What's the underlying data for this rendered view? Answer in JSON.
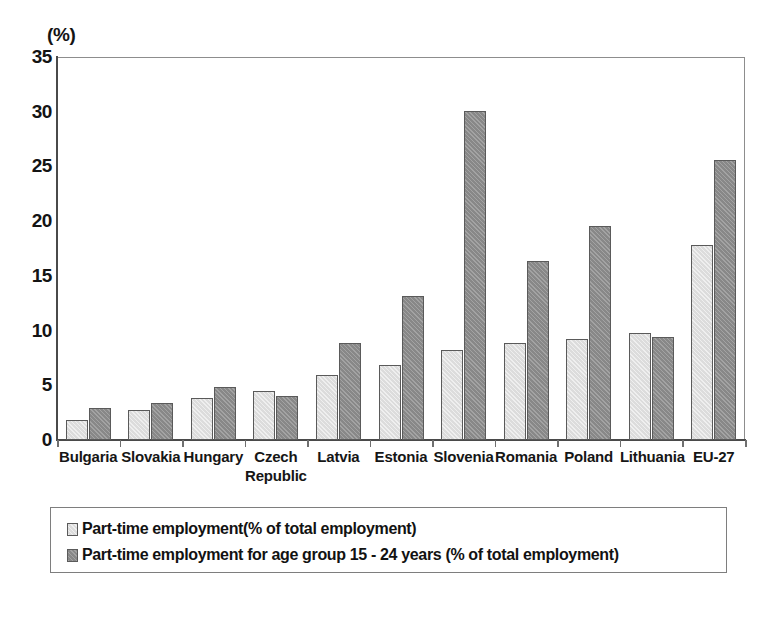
{
  "chart_data": {
    "type": "bar",
    "title": "",
    "subtitle": "",
    "xlabel": "",
    "ylabel": "",
    "unit_label": "(%)",
    "ylim": [
      0,
      35
    ],
    "yticks": [
      35,
      30,
      25,
      20,
      15,
      10,
      5,
      0
    ],
    "grid": false,
    "legend_position": "bottom",
    "categories": [
      "Bulgaria",
      "Slovakia",
      "Hungary",
      "Czech\nRepublic",
      "Latvia",
      "Estonia",
      "Slovenia",
      "Romania",
      "Poland",
      "Lithuania",
      "EU-27"
    ],
    "series": [
      {
        "name": "Part-time employment(% of total employment)",
        "color": "#dcdcdc",
        "values": [
          1.8,
          2.7,
          3.8,
          4.5,
          5.9,
          6.9,
          8.2,
          8.9,
          9.2,
          9.8,
          17.8
        ]
      },
      {
        "name": "Part-time employment for age group 15 - 24 years (% of total employment)",
        "color": "#8f8f8f",
        "values": [
          2.9,
          3.4,
          4.8,
          4.0,
          8.9,
          13.2,
          30.1,
          16.4,
          19.6,
          9.4,
          25.6
        ]
      }
    ]
  },
  "legend": {
    "entries": [
      "Part-time employment(% of total employment)",
      "Part-time employment for age group 15 - 24 years (% of total employment)"
    ]
  }
}
